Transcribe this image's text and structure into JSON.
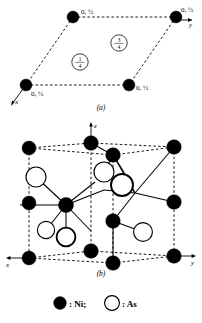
{
  "figure": {
    "title_implied": "NiAs crystal structure",
    "panels": [
      {
        "id": "a",
        "caption": "(a)",
        "description": "Basal-plane projection of the hexagonal NiAs cell",
        "axes": [
          {
            "name": "y",
            "label": "y",
            "direction": "right"
          },
          {
            "name": "x",
            "label": "x",
            "direction": "down-left"
          }
        ],
        "corner_labels": [
          {
            "id": "corner-top-left",
            "text": "0, ½"
          },
          {
            "id": "corner-top-right",
            "text": "0, ½"
          },
          {
            "id": "corner-bottom-left",
            "text": "0, ½"
          },
          {
            "id": "corner-bottom-right",
            "text": "0, ½"
          }
        ],
        "height_markers": [
          {
            "id": "height-marker-three-quarters",
            "numerator": "3",
            "denominator": "4",
            "text": "3/4"
          },
          {
            "id": "height-marker-one-quarter",
            "numerator": "1",
            "denominator": "4",
            "text": "1/4"
          }
        ]
      },
      {
        "id": "b",
        "caption": "(b)",
        "description": "Perspective view of the NiAs unit cell",
        "axes": [
          {
            "name": "z",
            "label": "z",
            "direction": "up"
          },
          {
            "name": "x",
            "label": "x",
            "direction": "left"
          },
          {
            "name": "y",
            "label": "y",
            "direction": "right"
          }
        ]
      }
    ],
    "legend": {
      "items": [
        {
          "id": "legend-ni",
          "marker": "filled-circle",
          "text": ": Ni;",
          "species": "Ni"
        },
        {
          "id": "legend-as",
          "marker": "open-circle",
          "text": ": As",
          "species": "As"
        }
      ]
    },
    "colors": {
      "ni_fill": "#000000",
      "as_fill": "#ffffff",
      "stroke": "#000000",
      "background": "#ffffff"
    }
  }
}
